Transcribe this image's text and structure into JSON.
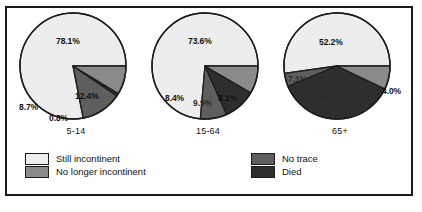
{
  "chart_data": {
    "type": "pie",
    "title": "",
    "legend_position": "bottom",
    "series_names": [
      "Still incontinent",
      "No longer incontinent",
      "No trace",
      "Died"
    ],
    "colors": {
      "still_incontinent": "#ededed",
      "no_longer_incontinent": "#8a8a8a",
      "no_trace": "#5e5e5e",
      "died": "#2e2e2e",
      "outline": "#1c1c1c",
      "background": "#ffffff"
    },
    "charts": [
      {
        "category": "5-14",
        "slices": [
          {
            "name": "Still incontinent",
            "value": 78.1,
            "label": "78.1%"
          },
          {
            "name": "No trace",
            "value": 12.4,
            "label": "12.4%"
          },
          {
            "name": "Died",
            "value": 0.8,
            "label": "0.8%"
          },
          {
            "name": "No longer incontinent",
            "value": 8.7,
            "label": "8.7%"
          }
        ]
      },
      {
        "category": "15-64",
        "slices": [
          {
            "name": "Still incontinent",
            "value": 73.6,
            "label": "73.6%"
          },
          {
            "name": "No trace",
            "value": 8.1,
            "label": "8.1%"
          },
          {
            "name": "Died",
            "value": 9.9,
            "label": "9.9%"
          },
          {
            "name": "No longer incontinent",
            "value": 8.4,
            "label": "8.4%"
          }
        ]
      },
      {
        "category": "65+",
        "slices": [
          {
            "name": "Still incontinent",
            "value": 52.2,
            "label": "52.2%"
          },
          {
            "name": "No trace",
            "value": 4.0,
            "label": "4.0%"
          },
          {
            "name": "Died",
            "value": 36.6,
            "label": "36.6%"
          },
          {
            "name": "No longer incontinent",
            "value": 7.1,
            "label": "7.1%"
          }
        ]
      }
    ]
  },
  "legend": {
    "left": [
      {
        "label": "Still incontinent",
        "color": "#ededed"
      },
      {
        "label": "No longer incontinent",
        "color": "#8a8a8a"
      }
    ],
    "right": [
      {
        "label": "No trace",
        "color": "#5e5e5e"
      },
      {
        "label": "Died",
        "color": "#2e2e2e"
      }
    ]
  }
}
